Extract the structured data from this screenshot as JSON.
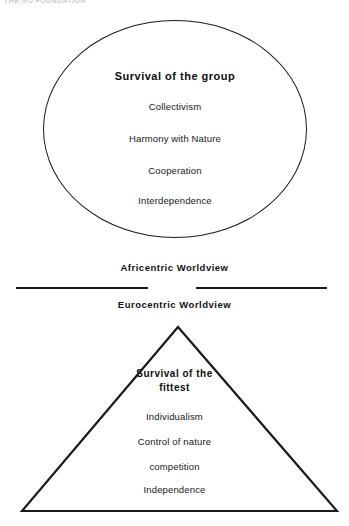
{
  "page": {
    "header_fragment": "THE GO FOUNDATION"
  },
  "africentric": {
    "shape": "oval",
    "worldview_label": "Africentric Worldview",
    "title": "Survival of the group",
    "items": [
      "Collectivism",
      "Harmony with Nature",
      "Cooperation",
      "Interdependence"
    ]
  },
  "eurocentric": {
    "shape": "triangle",
    "worldview_label": "Eurocentric Worldview",
    "title_line1": "Survival of the",
    "title_line2": "fittest",
    "items": [
      "Individualism",
      "Control of nature",
      "competition",
      "Independence"
    ]
  },
  "style": {
    "stroke_color": "#1a1a1a",
    "text_color": "#17171a",
    "background": "#ffffff"
  }
}
